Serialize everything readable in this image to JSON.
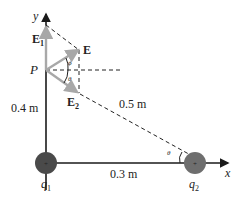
{
  "diagram": {
    "axes": {
      "x_label": "x",
      "y_label": "y"
    },
    "point": {
      "label": "P"
    },
    "vectors": {
      "E": "E",
      "E1_base": "E",
      "E1_sub": "1",
      "E2_base": "E",
      "E2_sub": "2"
    },
    "angles": {
      "phi": "ϕ",
      "theta": "θ",
      "theta_at_q2": "θ"
    },
    "distances": {
      "vertical": "0.4 m",
      "horizontal": "0.3 m",
      "diagonal": "0.5 m"
    },
    "charges": {
      "q1_base": "q",
      "q1_sub": "1",
      "q2_base": "q",
      "q2_sub": "2",
      "sign": "+"
    },
    "colors": {
      "axis": "#1a1a1a",
      "vector": "#a8a8a8",
      "dashed": "#222222",
      "charge_q1": "#4a4a4a",
      "charge_q2": "#6e6e6e"
    }
  }
}
